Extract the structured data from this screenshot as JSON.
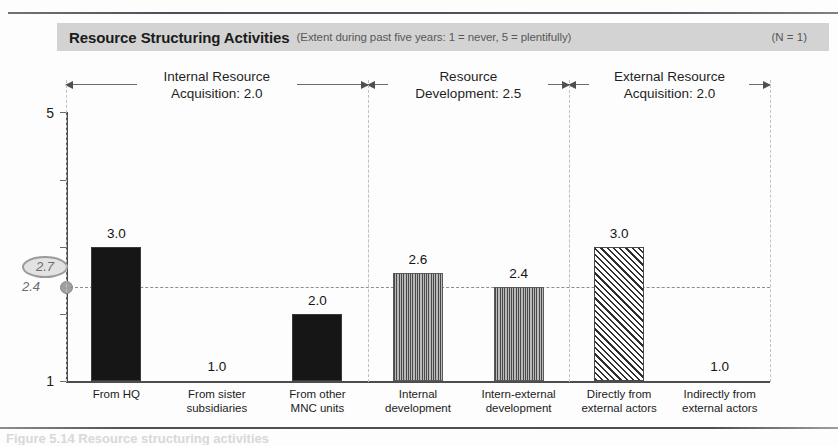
{
  "banner": {
    "title": "Resource Structuring Activities",
    "subtitle": "(Extent during past five years: 1 = never, 5 = plentifully)",
    "sample": "(N = 1)",
    "background_color": "#d3d3d3"
  },
  "axis": {
    "y_max_label": "5",
    "y_min_label": "1",
    "reference_value_label": "2.4",
    "highlight_value_label": "2.7"
  },
  "groups": [
    {
      "name": "internal-resource-acquisition",
      "line1": "Internal Resource",
      "line2": "Acquisition: 2.0",
      "mean": 2.0
    },
    {
      "name": "resource-development",
      "line1": "Resource",
      "line2": "Development: 2.5",
      "mean": 2.5
    },
    {
      "name": "external-resource-acquisition",
      "line1": "External Resource",
      "line2": "Acquisition: 2.0",
      "mean": 2.0
    }
  ],
  "caption": {
    "text": "Figure 5.14 Resource structuring activities"
  },
  "chart_data": {
    "type": "bar",
    "title": "Resource Structuring Activities",
    "subtitle": "(Extent during past five years: 1 = never, 5 = plentifully)",
    "xlabel": "",
    "ylabel": "",
    "ylim": [
      1,
      5
    ],
    "grid": false,
    "legend": "none",
    "annotations": [
      {
        "label": "2.7",
        "type": "highlighted-oval",
        "value": 2.7
      },
      {
        "label": "2.4",
        "type": "reference-dashed-line",
        "value": 2.4
      }
    ],
    "group_means": [
      {
        "group": "Internal Resource Acquisition",
        "value": 2.0
      },
      {
        "group": "Resource Development",
        "value": 2.5
      },
      {
        "group": "External Resource Acquisition",
        "value": 2.0
      }
    ],
    "categories": [
      "From HQ",
      "From sister subsidiaries",
      "From other MNC units",
      "Internal development",
      "Intern-external development",
      "Directly from external actors",
      "Indirectly from external actors"
    ],
    "values": [
      3.0,
      1.0,
      2.0,
      2.6,
      2.4,
      3.0,
      1.0
    ],
    "value_labels": [
      "3.0",
      "1.0",
      "2.0",
      "2.6",
      "2.4",
      "3.0",
      "1.0"
    ],
    "bars": [
      {
        "label_line1": "From HQ",
        "label_line2": "",
        "value": 3.0,
        "value_label": "3.0",
        "fill": "solid-black",
        "group": 0
      },
      {
        "label_line1": "From sister",
        "label_line2": "subsidiaries",
        "value": 1.0,
        "value_label": "1.0",
        "fill": "none",
        "group": 0
      },
      {
        "label_line1": "From other",
        "label_line2": "MNC units",
        "value": 2.0,
        "value_label": "2.0",
        "fill": "solid-black",
        "group": 0
      },
      {
        "label_line1": "Internal",
        "label_line2": "development",
        "value": 2.6,
        "value_label": "2.6",
        "fill": "vertical-hatch",
        "group": 1
      },
      {
        "label_line1": "Intern-external",
        "label_line2": "development",
        "value": 2.4,
        "value_label": "2.4",
        "fill": "vertical-hatch",
        "group": 1
      },
      {
        "label_line1": "Directly from",
        "label_line2": "external actors",
        "value": 3.0,
        "value_label": "3.0",
        "fill": "diagonal-hatch",
        "group": 2
      },
      {
        "label_line1": "Indirectly from",
        "label_line2": "external actors",
        "value": 1.0,
        "value_label": "1.0",
        "fill": "none",
        "group": 2
      }
    ]
  }
}
